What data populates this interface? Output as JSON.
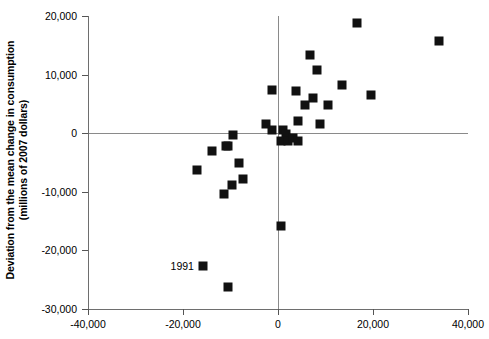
{
  "chart_data": {
    "type": "scatter",
    "title": "",
    "xlabel": "",
    "ylabel": "Deviation from the mean change in consumption (millions of 2007 dollars)",
    "ylabel_line1": "Deviation from the mean change in consumption",
    "ylabel_line2": "(millions of 2007 dollars)",
    "xlim": [
      -40000,
      40000
    ],
    "ylim": [
      -30000,
      20000
    ],
    "xticks": [
      -40000,
      -20000,
      0,
      20000,
      40000
    ],
    "xticklabels": [
      "-40,000",
      "-20,000",
      "0",
      "20,000",
      "40,000"
    ],
    "yticks": [
      20000,
      10000,
      0,
      -10000,
      -20000,
      -30000
    ],
    "yticklabels": [
      "20,000",
      "10,000",
      "0",
      "-10,000",
      "-20,000",
      "-30,000"
    ],
    "grid": false,
    "legend": null,
    "marker": "square",
    "marker_color": "#111111",
    "axis_color": "#8a8a8a",
    "points": [
      {
        "x": 16700,
        "y": 18800
      },
      {
        "x": 33900,
        "y": 15700
      },
      {
        "x": 6700,
        "y": 13400
      },
      {
        "x": 8200,
        "y": 10800
      },
      {
        "x": 13500,
        "y": 8300
      },
      {
        "x": 19600,
        "y": 6600
      },
      {
        "x": 7300,
        "y": 6000
      },
      {
        "x": 3700,
        "y": 7200
      },
      {
        "x": -1300,
        "y": 7400
      },
      {
        "x": 10500,
        "y": 4800
      },
      {
        "x": 5600,
        "y": 4800
      },
      {
        "x": 4200,
        "y": 2000
      },
      {
        "x": -2500,
        "y": 1500
      },
      {
        "x": -1300,
        "y": 600
      },
      {
        "x": 8800,
        "y": 1500
      },
      {
        "x": 1000,
        "y": 500
      },
      {
        "x": 1600,
        "y": -200
      },
      {
        "x": 600,
        "y": -1400
      },
      {
        "x": 2100,
        "y": -1400
      },
      {
        "x": 3200,
        "y": -900
      },
      {
        "x": 4300,
        "y": -1300
      },
      {
        "x": -9500,
        "y": -300
      },
      {
        "x": -13800,
        "y": -3100
      },
      {
        "x": -11000,
        "y": -2100
      },
      {
        "x": -10500,
        "y": -2100
      },
      {
        "x": -17000,
        "y": -6200
      },
      {
        "x": -8200,
        "y": -5100
      },
      {
        "x": -7300,
        "y": -7900
      },
      {
        "x": -9700,
        "y": -8800
      },
      {
        "x": -11400,
        "y": -10300
      },
      {
        "x": 700,
        "y": -15800
      },
      {
        "x": -15800,
        "y": -22700
      },
      {
        "x": -10600,
        "y": -26200
      }
    ],
    "annotations": [
      {
        "text": "1991",
        "x": -15800,
        "y": -22700,
        "label_offset_px": [
          -9,
          0
        ]
      }
    ]
  }
}
